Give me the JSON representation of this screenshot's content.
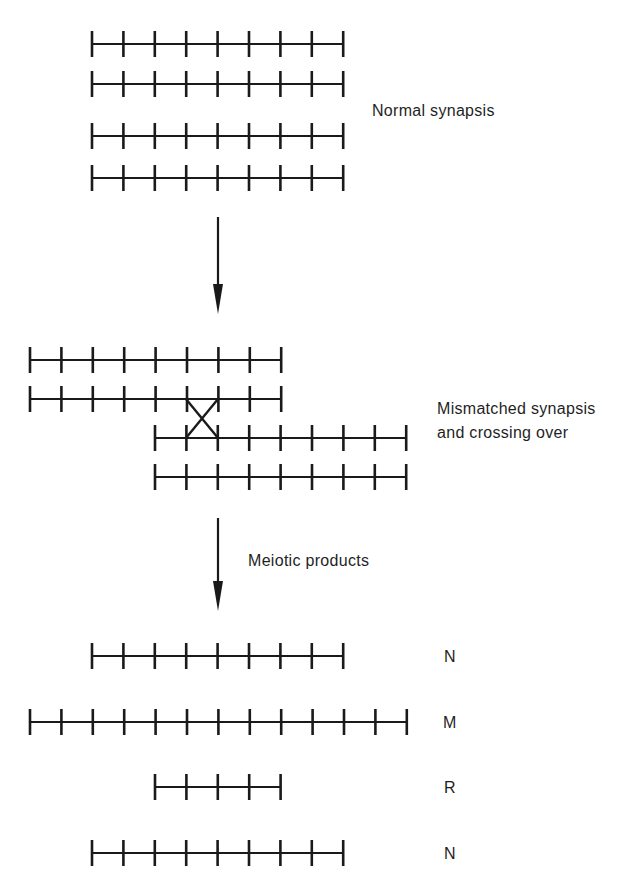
{
  "colors": {
    "ink": "#1a1a1a",
    "background": "#ffffff"
  },
  "stages": {
    "normal": {
      "label": "Normal synapsis",
      "chromatids": [
        {
          "x_start": 92,
          "y": 44,
          "segments": 8
        },
        {
          "x_start": 92,
          "y": 84,
          "segments": 8
        },
        {
          "x_start": 92,
          "y": 136,
          "segments": 8
        },
        {
          "x_start": 92,
          "y": 178,
          "segments": 8
        }
      ]
    },
    "arrow1": {
      "x": 218,
      "y1": 217,
      "y2": 314
    },
    "mismatched": {
      "label_line1": "Mismatched synapsis",
      "label_line2": "and crossing over",
      "chromatids": [
        {
          "x_start": 30,
          "y": 360,
          "segments": 8
        },
        {
          "x_start": 30,
          "y": 399,
          "segments": 8
        },
        {
          "x_start": 155,
          "y": 438,
          "segments": 8
        },
        {
          "x_start": 155,
          "y": 477,
          "segments": 8
        }
      ],
      "crossover": {
        "x1": 186,
        "x2": 218,
        "y1": 399,
        "y2": 438
      }
    },
    "arrow2": {
      "x": 218,
      "y1": 518,
      "y2": 611,
      "label": "Meiotic products"
    },
    "products": [
      {
        "label": "N",
        "x_start": 92,
        "y": 656,
        "segments": 8
      },
      {
        "label": "M",
        "x_start": 30,
        "y": 722,
        "segments": 12
      },
      {
        "label": "R",
        "x_start": 155,
        "y": 787,
        "segments": 4
      },
      {
        "label": "N",
        "x_start": 92,
        "y": 853,
        "segments": 8
      }
    ]
  },
  "segment_width": 31.4
}
